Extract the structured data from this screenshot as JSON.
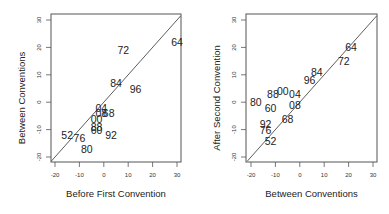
{
  "chart_data": [
    {
      "type": "scatter",
      "title": "",
      "xlabel": "Before First Convention",
      "ylabel": "Between Conventions",
      "xlim": [
        -21.5,
        31.5
      ],
      "ylim": [
        -21.5,
        31.5
      ],
      "xticks": [
        -20,
        -10,
        0,
        10,
        20,
        30
      ],
      "yticks": [
        -20,
        -10,
        0,
        10,
        20,
        30
      ],
      "grid": false,
      "reference_line": "y = x",
      "marker": "text labels (election year)",
      "points": [
        {
          "label": "64",
          "x": 30,
          "y": 22
        },
        {
          "label": "72",
          "x": 8,
          "y": 19
        },
        {
          "label": "84",
          "x": 5,
          "y": 7
        },
        {
          "label": "96",
          "x": 13,
          "y": 5
        },
        {
          "label": "04",
          "x": -1,
          "y": -2
        },
        {
          "label": "08",
          "x": -1,
          "y": -4
        },
        {
          "label": "68",
          "x": 2,
          "y": -4
        },
        {
          "label": "00",
          "x": -3,
          "y": -6
        },
        {
          "label": "88",
          "x": -3,
          "y": -9
        },
        {
          "label": "60",
          "x": -3,
          "y": -10
        },
        {
          "label": "92",
          "x": 3,
          "y": -12
        },
        {
          "label": "52",
          "x": -15,
          "y": -12
        },
        {
          "label": "76",
          "x": -10,
          "y": -13
        },
        {
          "label": "80",
          "x": -7,
          "y": -17
        }
      ]
    },
    {
      "type": "scatter",
      "title": "",
      "xlabel": "Between Conventions",
      "ylabel": "After Second Convention",
      "xlim": [
        -21.5,
        31.5
      ],
      "ylim": [
        -21.5,
        31.5
      ],
      "xticks": [
        -20,
        -10,
        0,
        10,
        20,
        30
      ],
      "yticks": [
        -20,
        -10,
        0,
        10,
        20,
        30
      ],
      "grid": false,
      "reference_line": "y = x",
      "marker": "text labels (election year)",
      "points": [
        {
          "label": "64",
          "x": 21,
          "y": 20
        },
        {
          "label": "72",
          "x": 18,
          "y": 15
        },
        {
          "label": "84",
          "x": 7,
          "y": 11
        },
        {
          "label": "96",
          "x": 4,
          "y": 8
        },
        {
          "label": "00",
          "x": -7,
          "y": 4
        },
        {
          "label": "88",
          "x": -11,
          "y": 3
        },
        {
          "label": "04",
          "x": -2,
          "y": 3
        },
        {
          "label": "80",
          "x": -18,
          "y": 0
        },
        {
          "label": "08",
          "x": -2,
          "y": -1
        },
        {
          "label": "60",
          "x": -12,
          "y": -2
        },
        {
          "label": "68",
          "x": -5,
          "y": -6
        },
        {
          "label": "92",
          "x": -14,
          "y": -8
        },
        {
          "label": "76",
          "x": -14,
          "y": -10
        },
        {
          "label": "52",
          "x": -12,
          "y": -14
        }
      ]
    }
  ]
}
